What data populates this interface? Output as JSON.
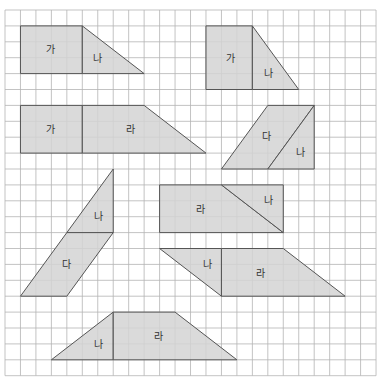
{
  "grid": {
    "origin_x": 5,
    "origin_y": 10,
    "cell_w": 15.46,
    "cell_h": 15.9,
    "cols": 24,
    "rows": 23,
    "line_color": "#b4b4b4"
  },
  "colors": {
    "fill": "#d3d3d3",
    "fill_alt": "#dadada",
    "outline": "#555555",
    "label": "#333333",
    "background": "#ffffff"
  },
  "figures": [
    {
      "name": "figure-ga-na-top-left",
      "pieces": [
        {
          "label": "가",
          "points": [
            [
              1,
              1
            ],
            [
              5,
              1
            ],
            [
              5,
              4
            ],
            [
              1,
              4
            ]
          ],
          "label_pos": [
            50,
            53
          ]
        },
        {
          "label": "나",
          "points": [
            [
              5,
              1
            ],
            [
              9,
              4
            ],
            [
              5,
              4
            ]
          ],
          "label_pos": [
            97,
            62
          ]
        }
      ]
    },
    {
      "name": "figure-ga-na-top-right",
      "pieces": [
        {
          "label": "가",
          "points": [
            [
              13,
              1
            ],
            [
              16,
              1
            ],
            [
              16,
              5
            ],
            [
              13,
              5
            ]
          ],
          "label_pos": [
            230,
            62
          ]
        },
        {
          "label": "나",
          "points": [
            [
              16,
              1
            ],
            [
              19,
              5
            ],
            [
              16,
              5
            ]
          ],
          "label_pos": [
            268,
            77
          ]
        }
      ]
    },
    {
      "name": "figure-ga-ra",
      "pieces": [
        {
          "label": "가",
          "points": [
            [
              1,
              6
            ],
            [
              5,
              6
            ],
            [
              5,
              9
            ],
            [
              1,
              9
            ]
          ],
          "label_pos": [
            50,
            133
          ]
        },
        {
          "label": "라",
          "points": [
            [
              5,
              6
            ],
            [
              9,
              6
            ],
            [
              13,
              9
            ],
            [
              5,
              9
            ]
          ],
          "label_pos": [
            130,
            133
          ]
        }
      ]
    },
    {
      "name": "figure-da-na-right",
      "pieces": [
        {
          "label": "다",
          "points": [
            [
              17,
              6
            ],
            [
              20,
              6
            ],
            [
              17,
              10
            ],
            [
              14,
              10
            ]
          ],
          "label_pos": [
            266,
            140
          ]
        },
        {
          "label": "나",
          "points": [
            [
              20,
              6
            ],
            [
              20,
              10
            ],
            [
              17,
              10
            ]
          ],
          "label_pos": [
            300,
            156
          ]
        }
      ]
    },
    {
      "name": "figure-na-da-left",
      "pieces": [
        {
          "label": "나",
          "points": [
            [
              7,
              10
            ],
            [
              7,
              14
            ],
            [
              4,
              14
            ]
          ],
          "label_pos": [
            98,
            220
          ]
        },
        {
          "label": "다",
          "points": [
            [
              4,
              14
            ],
            [
              7,
              14
            ],
            [
              4,
              18
            ],
            [
              1,
              18
            ]
          ],
          "label_pos": [
            66,
            268
          ]
        }
      ]
    },
    {
      "name": "figure-ra-na",
      "pieces": [
        {
          "label": "라",
          "points": [
            [
              10,
              11
            ],
            [
              14,
              11
            ],
            [
              18,
              14
            ],
            [
              10,
              14
            ]
          ],
          "label_pos": [
            200,
            213
          ]
        },
        {
          "label": "나",
          "points": [
            [
              14,
              11
            ],
            [
              18,
              11
            ],
            [
              18,
              14
            ]
          ],
          "label_pos": [
            268,
            204
          ]
        }
      ]
    },
    {
      "name": "figure-na-ra-lower",
      "pieces": [
        {
          "label": "나",
          "points": [
            [
              10,
              15
            ],
            [
              14,
              15
            ],
            [
              14,
              18
            ]
          ],
          "label_pos": [
            207,
            268
          ]
        },
        {
          "label": "라",
          "points": [
            [
              14,
              15
            ],
            [
              18,
              15
            ],
            [
              22,
              18
            ],
            [
              14,
              18
            ]
          ],
          "label_pos": [
            260,
            277
          ]
        }
      ]
    },
    {
      "name": "figure-na-ra-bottom",
      "pieces": [
        {
          "label": "나",
          "points": [
            [
              7,
              19
            ],
            [
              7,
              22
            ],
            [
              3,
              22
            ]
          ],
          "label_pos": [
            98,
            348
          ]
        },
        {
          "label": "라",
          "points": [
            [
              7,
              19
            ],
            [
              11,
              19
            ],
            [
              15,
              22
            ],
            [
              7,
              22
            ]
          ],
          "label_pos": [
            158,
            340
          ]
        }
      ]
    }
  ]
}
